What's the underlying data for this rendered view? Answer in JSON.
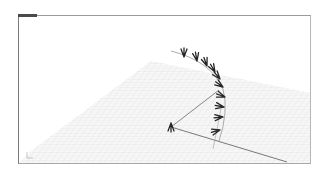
{
  "viewport": {
    "label": "Perspective",
    "background": "#ffffff",
    "grid_color": "#cfcfcf",
    "axis_line_color": "#6a6a6a",
    "arrow_color": "#2a2a2a"
  },
  "scene": {
    "objects": [
      {
        "type": "grid-plane",
        "name": "construction-plane"
      },
      {
        "type": "arc",
        "name": "arc-curve"
      },
      {
        "type": "line",
        "name": "radius-line"
      },
      {
        "type": "line",
        "name": "x-axis-line"
      },
      {
        "type": "arrow-array",
        "count": 10,
        "name": "tangent-arrows"
      }
    ]
  },
  "axis_icon": {
    "label": "world-axes"
  }
}
